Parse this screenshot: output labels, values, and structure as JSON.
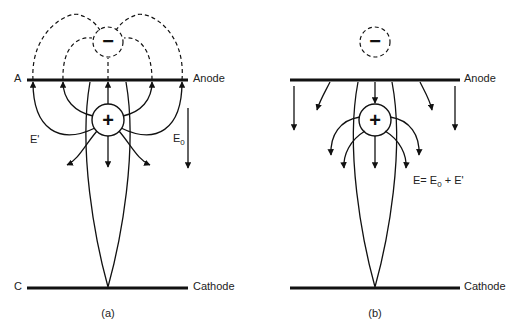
{
  "panels": [
    {
      "id": "a",
      "caption": "(a)",
      "anode_short": "A",
      "anode_label": "Anode",
      "cathode_short": "C",
      "cathode_label": "Cathode",
      "positive_charge": "+",
      "negative_charge": "−",
      "field_space_charge_label": "E'",
      "field_applied_label": "E",
      "field_applied_sub": "0"
    },
    {
      "id": "b",
      "caption": "(b)",
      "anode_label": "Anode",
      "cathode_label": "Cathode",
      "positive_charge": "+",
      "negative_charge": "−",
      "resultant_label_prefix": "E= E",
      "resultant_label_sub": "0",
      "resultant_label_suffix": " + E'"
    }
  ]
}
